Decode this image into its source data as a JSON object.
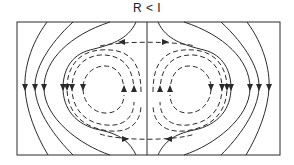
{
  "diagram": {
    "title": "R < I",
    "colors": {
      "stroke": "#2a2a2a",
      "background": "#ffffff"
    },
    "box": {
      "x": 17,
      "y": 22,
      "width": 263,
      "height": 133
    },
    "center_line_x": 147,
    "arrow_row_y": 88,
    "elements": {
      "outer_streamlines": "solid lines flowing downward on both sides",
      "separatrix": "solid closed curve around recirculation cells",
      "recirculation_cells": "two dashed counter-rotating vortices",
      "top_arrows": "left-pointing and right-pointing arrows along top dashed line",
      "bottom_arrows": "right-pointing and left-pointing arrows along bottom dashed line",
      "center_arrows": "upward arrows near central axis"
    }
  }
}
